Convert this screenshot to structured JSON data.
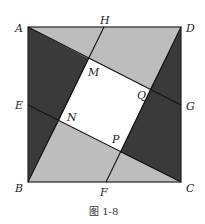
{
  "figure": {
    "caption": "图 1-8",
    "colors": {
      "dark": "#3a3a3a",
      "light": "#bdbdbd",
      "center": "#ffffff",
      "line": "#222222"
    },
    "points": {
      "A": {
        "label": "A",
        "x": 28,
        "y": 27
      },
      "D": {
        "label": "D",
        "x": 181,
        "y": 27
      },
      "B": {
        "label": "B",
        "x": 28,
        "y": 182
      },
      "C": {
        "label": "C",
        "x": 181,
        "y": 182
      },
      "H": {
        "label": "H",
        "x": 104,
        "y": 27
      },
      "F": {
        "label": "F",
        "x": 106,
        "y": 182
      },
      "E": {
        "label": "E",
        "x": 28,
        "y": 105
      },
      "G": {
        "label": "G",
        "x": 181,
        "y": 105
      },
      "M": {
        "label": "M",
        "x": 89,
        "y": 59
      },
      "N": {
        "label": "N",
        "x": 59,
        "y": 121
      },
      "P": {
        "label": "P",
        "x": 120,
        "y": 152
      },
      "Q": {
        "label": "Q",
        "x": 150,
        "y": 89
      }
    }
  }
}
